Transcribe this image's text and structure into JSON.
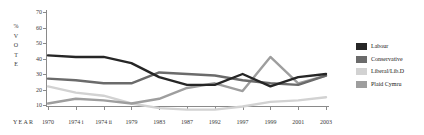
{
  "chart_data": {
    "type": "line",
    "title": "",
    "xlabel": "YEAR",
    "ylabel": "% VOTE",
    "ylim": [
      0,
      70
    ],
    "yticks": [
      10,
      20,
      30,
      40,
      50,
      60,
      70
    ],
    "grid": false,
    "legend_position": "right",
    "categories": [
      "1970",
      "1974 i",
      "1974 ii",
      "1979",
      "1983",
      "1987",
      "1992",
      "1997",
      "1999",
      "2001",
      "2003"
    ],
    "series": [
      {
        "name": "Labour",
        "color": "#262626",
        "values": [
          42,
          41,
          41,
          37,
          28,
          23,
          23,
          30,
          22,
          28,
          30
        ]
      },
      {
        "name": "Conservative",
        "color": "#6b6b6b",
        "values": [
          27,
          26,
          24,
          24,
          31,
          30,
          29,
          26,
          24,
          23,
          29
        ]
      },
      {
        "name": "Liberal/Lib.D",
        "color": "#d2d2d2",
        "values": [
          22,
          18,
          16,
          11,
          8,
          7,
          7,
          9,
          12,
          13,
          15
        ]
      },
      {
        "name": "Plaid Cymru",
        "color": "#9e9e9e",
        "values": [
          11,
          14,
          13,
          11,
          14,
          21,
          24,
          19,
          41,
          24,
          29
        ]
      }
    ]
  },
  "axis": {
    "ylabel_chars": [
      "%",
      "V",
      "O",
      "T",
      "E"
    ],
    "year_label": "YEAR"
  },
  "legend": {
    "items": [
      {
        "label": "Labour"
      },
      {
        "label": "Conservative"
      },
      {
        "label": "Liberal/Lib.D"
      },
      {
        "label": "Plaid Cymru"
      }
    ]
  }
}
